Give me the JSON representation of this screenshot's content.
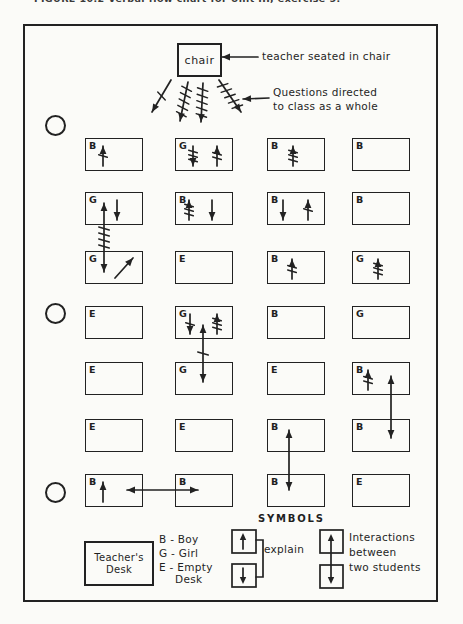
{
  "caption": "FIGURE 10.2   Verbal flow chart for Unit III, exercise 5.",
  "colors": {
    "ink": "#222222",
    "paper": "#fbfbf8"
  },
  "chair": {
    "label": "chair"
  },
  "annotations": {
    "teacher_note": "teacher seated in chair",
    "questions_line1": "Questions directed",
    "questions_line2": "to class as a whole"
  },
  "pointer_arrows": [
    {
      "x1": 258,
      "y1": 57,
      "x2": 222,
      "y2": 57
    },
    {
      "x1": 269,
      "y1": 98,
      "x2": 243,
      "y2": 99
    }
  ],
  "fan_arrows": [
    {
      "x1": 171,
      "y1": 80,
      "x2": 152,
      "y2": 112,
      "ticks": 1
    },
    {
      "x1": 188,
      "y1": 82,
      "x2": 180,
      "y2": 121,
      "ticks": 5
    },
    {
      "x1": 203,
      "y1": 83,
      "x2": 201,
      "y2": 122,
      "ticks": 5
    },
    {
      "x1": 219,
      "y1": 80,
      "x2": 241,
      "y2": 112,
      "ticks": 5
    }
  ],
  "grid": {
    "cols_x": [
      85,
      175,
      267,
      352
    ],
    "rows_y": [
      138,
      192,
      251,
      306,
      362,
      419,
      474
    ],
    "box_w": 58,
    "box_h": 33,
    "desks": [
      [
        {
          "letter": "B",
          "arrows": [
            {
              "dx": 18,
              "dir": "up",
              "ticks": 1
            }
          ]
        },
        {
          "letter": "G",
          "arrows": [
            {
              "dx": 18,
              "dir": "down",
              "ticks": 3
            },
            {
              "dx": 42,
              "dir": "up",
              "ticks": 2
            }
          ]
        },
        {
          "letter": "B",
          "arrows": [
            {
              "dx": 26,
              "dir": "up",
              "ticks": 3
            }
          ]
        },
        {
          "letter": "B",
          "arrows": []
        }
      ],
      [
        {
          "letter": "G",
          "arrows": [
            {
              "dx": 32,
              "dir": "down",
              "ticks": 0
            }
          ]
        },
        {
          "letter": "B",
          "arrows": [
            {
              "dx": 14,
              "dir": "up",
              "ticks": 3
            },
            {
              "dx": 37,
              "dir": "down",
              "ticks": 0
            }
          ]
        },
        {
          "letter": "B",
          "arrows": [
            {
              "dx": 16,
              "dir": "down",
              "ticks": 0
            },
            {
              "dx": 41,
              "dir": "up",
              "ticks": 1
            }
          ]
        },
        {
          "letter": "B",
          "arrows": []
        }
      ],
      [
        {
          "letter": "G",
          "arrows": [
            {
              "dx": 30,
              "dir": "ne",
              "ticks": 0
            }
          ]
        },
        {
          "letter": "E",
          "arrows": []
        },
        {
          "letter": "B",
          "arrows": [
            {
              "dx": 25,
              "dir": "up",
              "ticks": 2
            }
          ]
        },
        {
          "letter": "G",
          "arrows": [
            {
              "dx": 26,
              "dir": "up",
              "ticks": 3
            }
          ]
        }
      ],
      [
        {
          "letter": "E",
          "arrows": []
        },
        {
          "letter": "G",
          "arrows": [
            {
              "dx": 15,
              "dir": "down",
              "ticks": 1
            },
            {
              "dx": 42,
              "dir": "up",
              "ticks": 3
            }
          ]
        },
        {
          "letter": "B",
          "arrows": []
        },
        {
          "letter": "G",
          "arrows": []
        }
      ],
      [
        {
          "letter": "E",
          "arrows": []
        },
        {
          "letter": "G",
          "arrows": []
        },
        {
          "letter": "E",
          "arrows": []
        },
        {
          "letter": "B",
          "arrows": [
            {
              "dx": 16,
              "dir": "up",
              "ticks": 2
            }
          ]
        }
      ],
      [
        {
          "letter": "E",
          "arrows": []
        },
        {
          "letter": "E",
          "arrows": []
        },
        {
          "letter": "B",
          "arrows": []
        },
        {
          "letter": "B",
          "arrows": []
        }
      ],
      [
        {
          "letter": "B",
          "arrows": [
            {
              "dx": 18,
              "dir": "up",
              "ticks": 0
            }
          ]
        },
        {
          "letter": "B",
          "arrows": []
        },
        {
          "letter": "B",
          "arrows": []
        },
        {
          "letter": "E",
          "arrows": []
        }
      ]
    ]
  },
  "interactions": [
    {
      "type": "v",
      "x": 104,
      "y1": 272,
      "y2": 203,
      "ticks": 4
    },
    {
      "type": "v",
      "x": 203,
      "y1": 382,
      "y2": 325,
      "ticks": 1
    },
    {
      "type": "v",
      "x": 391,
      "y1": 438,
      "y2": 376,
      "ticks": 0
    },
    {
      "type": "v",
      "x": 289,
      "y1": 490,
      "y2": 430,
      "ticks": 0
    },
    {
      "type": "h",
      "y": 490,
      "x1": 127,
      "x2": 198,
      "ticks": 0
    }
  ],
  "legend": {
    "symbols_title": "SYMBOLS",
    "teachers_desk_line1": "Teacher's",
    "teachers_desk_line2": "Desk",
    "key_b": "B - Boy",
    "key_g": "G - Girl",
    "key_e": "E - Empty",
    "key_e2": "Desk",
    "explain_label": "explain",
    "interactions_line1": "Interactions",
    "interactions_line2": "between",
    "interactions_line3": "two students"
  }
}
